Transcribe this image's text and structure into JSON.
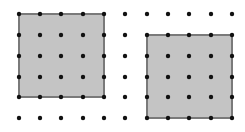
{
  "diagram": {
    "type": "dot-grid-with-squares",
    "grid": {
      "columns_x": [
        19,
        40,
        61,
        83,
        104,
        125,
        147,
        168,
        189,
        211,
        232
      ],
      "rows_y": [
        14,
        35,
        56,
        77,
        97,
        118
      ],
      "dot_radius": 2.2,
      "dot_color": "#111111"
    },
    "shapes": [
      {
        "name": "left-square",
        "col_start": 0,
        "col_end": 4,
        "row_start": 0,
        "row_end": 4,
        "fill": "#c4c4c4",
        "stroke": "#7a7a7a"
      },
      {
        "name": "right-square",
        "col_start": 6,
        "col_end": 10,
        "row_start": 1,
        "row_end": 5,
        "fill": "#c4c4c4",
        "stroke": "#7a7a7a"
      }
    ]
  }
}
